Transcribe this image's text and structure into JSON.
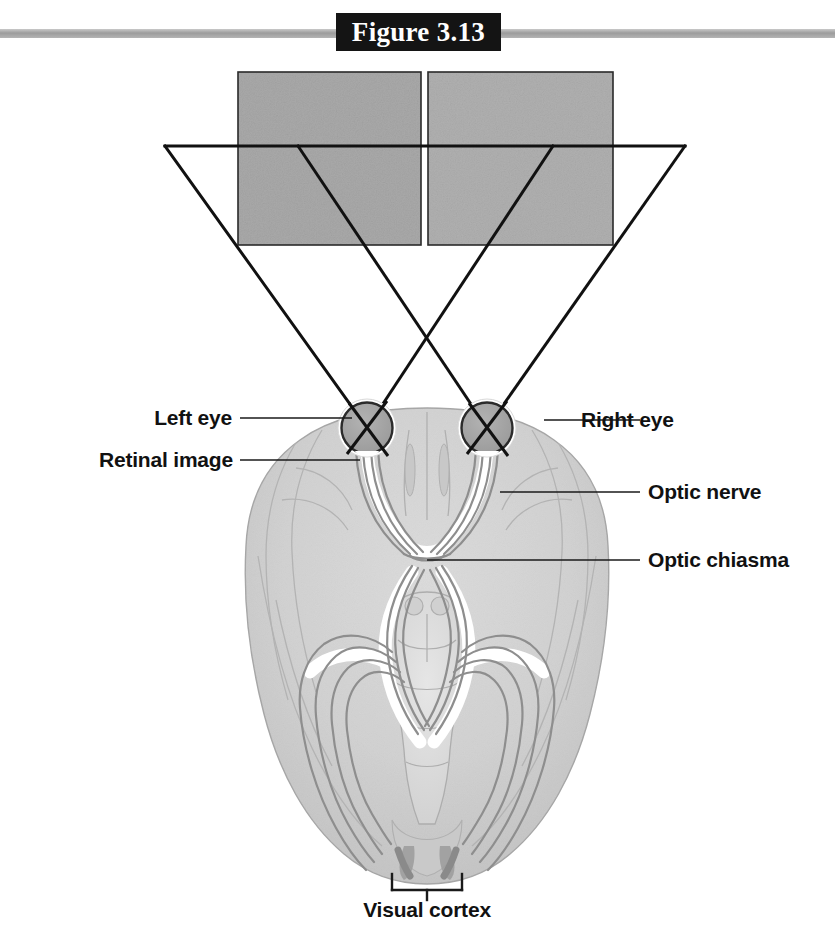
{
  "figure": {
    "header_title": "Figure 3.13",
    "header_plate_color": "#141414",
    "header_rule_color": "#9c9c9c",
    "background_color": "#ffffff"
  },
  "scene": {
    "description_labels": {
      "left_eye": "Left eye",
      "retinal_image": "Retinal image",
      "right_eye": "Right eye",
      "optic_nerve": "Optic nerve",
      "optic_chiasma": "Optic chiasma",
      "visual_cortex": "Visual cortex"
    },
    "visual_field": {
      "left_half_fill": "#a9a9a9",
      "right_half_fill": "#b0b0b0",
      "outline_color": "#1a1a1a"
    },
    "ray_color": "#111111",
    "brain": {
      "cortex_fill": "#d2d2d2",
      "cortex_inner_fill": "#c6c6c6",
      "brainstem_fill": "#dcdcdc",
      "outline_color": "#9a9a9a",
      "tract_color": "#8e8e8e",
      "tract_highlight": "#ffffff"
    },
    "eye": {
      "rim_color": "#ffffff",
      "outline_color": "#2b2b2b",
      "fill_color": "#a2a2a2",
      "diameter_px": 50
    }
  },
  "geometry": {
    "field_square_left": {
      "x": 238,
      "y": 72,
      "w": 183,
      "h": 173
    },
    "field_square_right": {
      "x": 428,
      "y": 72,
      "w": 185,
      "h": 173
    },
    "horizontal_ray": {
      "x1": 165,
      "y": 146,
      "x2": 685
    },
    "left_eye_center": {
      "x": 367,
      "y": 428
    },
    "right_eye_center": {
      "x": 487,
      "y": 428
    },
    "chiasma_center": {
      "x": 427,
      "y": 560
    },
    "visual_cortex_bracket": {
      "x1": 392,
      "x2": 462,
      "y": 890,
      "tick_top": 874,
      "stem_bottom": 898
    }
  }
}
